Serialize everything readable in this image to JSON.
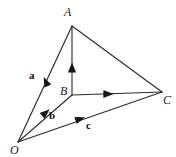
{
  "figure": {
    "kind": "vector-diagram",
    "width": 176,
    "height": 157,
    "background_color": "#ffffff",
    "ink_color": "#2b2b2b"
  },
  "points": [
    {
      "id": "A",
      "label": "A",
      "x": 72,
      "y": 26,
      "label_x": 64,
      "label_y": 6
    },
    {
      "id": "B",
      "label": "B",
      "x": 72,
      "y": 95,
      "label_x": 60,
      "label_y": 85
    },
    {
      "id": "C",
      "label": "C",
      "x": 162,
      "y": 92,
      "label_x": 163,
      "label_y": 94
    },
    {
      "id": "O",
      "label": "O",
      "x": 18,
      "y": 142,
      "label_x": 10,
      "label_y": 144
    }
  ],
  "vectors": [
    {
      "id": "a",
      "label": "a",
      "from": "O",
      "to": "A",
      "label_x": 29,
      "label_y": 70,
      "has_arrow": true
    },
    {
      "id": "b",
      "label": "b",
      "from": "O",
      "to": "B",
      "label_x": 49,
      "label_y": 110,
      "has_arrow": true
    },
    {
      "id": "c",
      "label": "c",
      "from": "O",
      "to": "C",
      "label_x": 86,
      "label_y": 120,
      "has_arrow": true
    }
  ],
  "edges": [
    {
      "id": "BA",
      "from": "B",
      "to": "A",
      "has_arrow": true
    },
    {
      "id": "BC",
      "from": "B",
      "to": "C",
      "has_arrow": true
    },
    {
      "id": "AC",
      "from": "A",
      "to": "C",
      "has_arrow": false
    }
  ]
}
